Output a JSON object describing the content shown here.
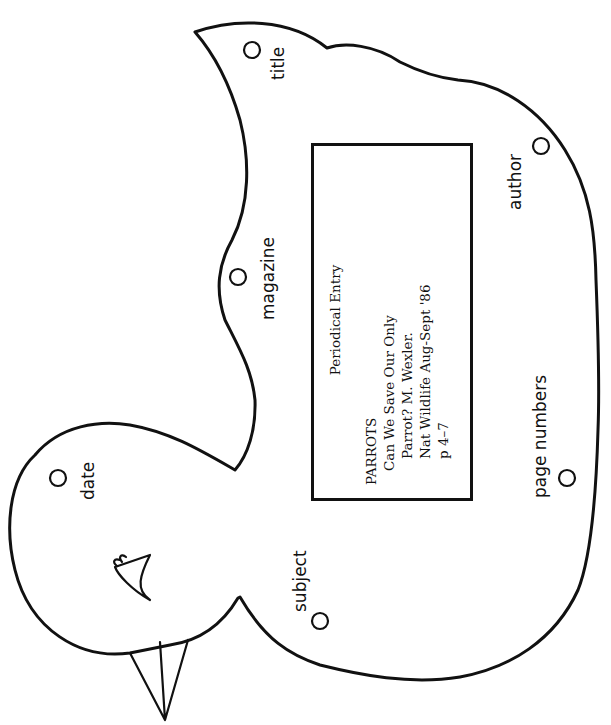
{
  "diagram": {
    "title": "Periodical Entry",
    "shape": "bird-outline",
    "entry": {
      "heading": "Periodical Entry",
      "lines": [
        "PARROTS",
        "Can We Save Our Only",
        "Parrot? M. Wexler.",
        "Nat Wildlife Aug-Sept '86",
        "p 4–7"
      ]
    },
    "labels": {
      "title": "title",
      "magazine": "magazine",
      "date": "date",
      "subject": "subject",
      "author": "author",
      "page_numbers": "page numbers"
    },
    "colors": {
      "stroke": "#111111",
      "background": "#ffffff"
    }
  }
}
